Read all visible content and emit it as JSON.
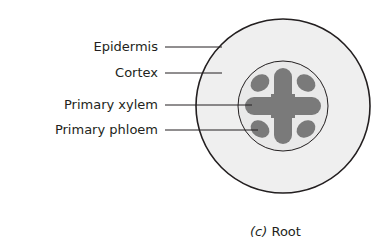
{
  "labels": [
    {
      "text": "Epidermis",
      "y": 47
    },
    {
      "text": "Cortex",
      "y": 73
    },
    {
      "text": "Primary xylem",
      "y": 105
    },
    {
      "text": "Primary phloem",
      "y": 130
    }
  ],
  "caption": {
    "part": "(c)",
    "title": "Root"
  },
  "colors": {
    "tissue_fill": "#efefef",
    "vascular_fill": "#7a7a7a",
    "outline": "#231f20"
  }
}
